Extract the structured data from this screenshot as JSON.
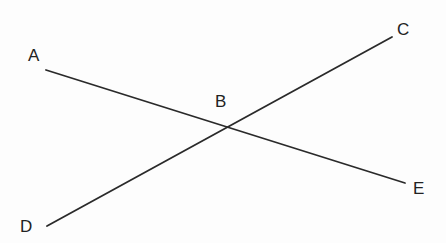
{
  "diagram": {
    "type": "intersecting-lines",
    "lines": [
      {
        "name": "AE",
        "from": "A",
        "to": "E",
        "x1": 46,
        "y1": 70,
        "x2": 405,
        "y2": 183
      },
      {
        "name": "DC",
        "from": "D",
        "to": "C",
        "x1": 47,
        "y1": 226,
        "x2": 392,
        "y2": 37
      }
    ],
    "labels": [
      {
        "text": "A",
        "x": 28,
        "y": 61
      },
      {
        "text": "B",
        "x": 215,
        "y": 107
      },
      {
        "text": "C",
        "x": 397,
        "y": 35
      },
      {
        "text": "D",
        "x": 20,
        "y": 232
      },
      {
        "text": "E",
        "x": 413,
        "y": 194
      }
    ],
    "intersection": {
      "label": "B",
      "x": 228,
      "y": 126
    }
  }
}
